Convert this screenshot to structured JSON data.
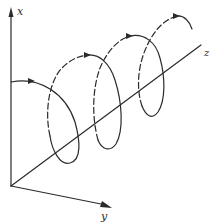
{
  "diagram": {
    "type": "3d-helix",
    "colors": {
      "stroke": "#2b2b2b",
      "background": "#ffffff"
    },
    "axes": {
      "x": {
        "label": "x",
        "direction": "up"
      },
      "y": {
        "label": "y",
        "direction": "down-right"
      },
      "z": {
        "label": "z",
        "direction": "right"
      }
    },
    "helix": {
      "turns": 3,
      "front_segments_style": "solid",
      "back_segments_style": "dashed",
      "direction_arrows": 4
    }
  }
}
